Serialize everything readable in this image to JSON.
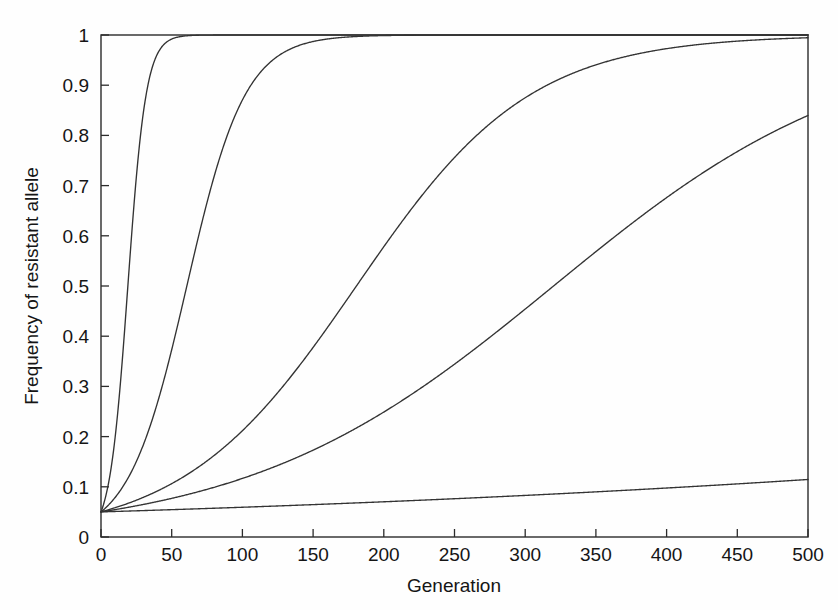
{
  "figure": {
    "background_color": "#fefefe",
    "axis_color": "#2b2b2b",
    "curve_color": "#333333"
  },
  "chart_data": {
    "type": "line",
    "title": "",
    "xlabel": "Generation",
    "ylabel": "Frequency of resistant allele",
    "xlim": [
      0,
      500
    ],
    "ylim": [
      0,
      1
    ],
    "xticks": [
      0,
      50,
      100,
      150,
      200,
      250,
      300,
      350,
      400,
      450,
      500
    ],
    "xticklabels": [
      "0",
      "50",
      "100",
      "150",
      "200",
      "250",
      "300",
      "350",
      "400",
      "450",
      "500"
    ],
    "yticks": [
      0,
      0.1,
      0.2,
      0.3,
      0.4,
      0.5,
      0.6,
      0.7,
      0.8,
      0.9,
      1
    ],
    "yticklabels": [
      "0",
      "0.1",
      "0.2",
      "0.3",
      "0.4",
      "0.5",
      "0.6",
      "0.7",
      "0.8",
      "0.9",
      "1"
    ],
    "grid": false,
    "legend": null,
    "initial_frequency": 0.05,
    "series": [
      {
        "name": "curve-1",
        "description": "fastest fixation, reaches 1 by generation ~35",
        "midpoint_generation": 19,
        "growth_rate": 0.155,
        "x": [
          0,
          5,
          10,
          15,
          19,
          25,
          30,
          35,
          40,
          60,
          100,
          200,
          300,
          400,
          500
        ],
        "values": [
          0.05,
          0.103,
          0.203,
          0.365,
          0.5,
          0.709,
          0.836,
          0.916,
          0.959,
          0.998,
          1.0,
          1.0,
          1.0,
          1.0,
          1.0
        ]
      },
      {
        "name": "curve-2",
        "description": "fast fixation, reaches 1 by generation ~95",
        "midpoint_generation": 61,
        "growth_rate": 0.0485,
        "x": [
          0,
          10,
          20,
          30,
          40,
          50,
          61,
          70,
          80,
          90,
          100,
          120,
          200,
          300,
          400,
          500
        ],
        "values": [
          0.05,
          0.079,
          0.124,
          0.188,
          0.275,
          0.383,
          0.5,
          0.589,
          0.684,
          0.765,
          0.829,
          0.915,
          0.998,
          1.0,
          1.0,
          1.0
        ]
      },
      {
        "name": "curve-3",
        "description": "moderate fixation, reaches 1 by generation ~265",
        "midpoint_generation": 185,
        "growth_rate": 0.0163,
        "x": [
          0,
          25,
          50,
          75,
          100,
          125,
          150,
          185,
          200,
          225,
          250,
          275,
          300,
          400,
          500
        ],
        "values": [
          0.05,
          0.074,
          0.108,
          0.155,
          0.217,
          0.295,
          0.385,
          0.5,
          0.545,
          0.634,
          0.714,
          0.782,
          0.838,
          0.962,
          0.992
        ]
      },
      {
        "name": "curve-4",
        "description": "slow sigmoid, approaches 0.98 at generation 500",
        "midpoint_generation": 392,
        "growth_rate": 0.0092,
        "x": [
          0,
          50,
          100,
          150,
          200,
          250,
          300,
          350,
          392,
          420,
          450,
          475,
          500
        ],
        "values": [
          0.05,
          0.078,
          0.12,
          0.18,
          0.263,
          0.364,
          0.477,
          0.59,
          0.5,
          0.757,
          0.815,
          0.853,
          0.882
        ]
      },
      {
        "name": "curve-5",
        "description": "slowest, nearly linear rise to ~0.12 at generation 500",
        "midpoint_generation": null,
        "growth_rate": 0.0018,
        "x": [
          0,
          50,
          100,
          150,
          200,
          250,
          300,
          350,
          400,
          450,
          500
        ],
        "values": [
          0.05,
          0.0546,
          0.0596,
          0.065,
          0.071,
          0.0775,
          0.0845,
          0.092,
          0.1,
          0.1085,
          0.1175
        ]
      }
    ]
  }
}
